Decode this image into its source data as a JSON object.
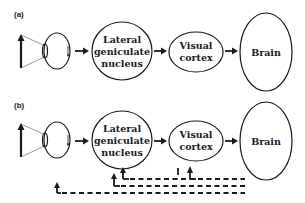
{
  "panels": [
    {
      "label": "(a)",
      "nodes": {
        "lgn": [
          "Lateral",
          "geniculate",
          "nucleus"
        ],
        "visual_cortex": [
          "Visual",
          "cortex"
        ],
        "brain": [
          "Brain"
        ]
      },
      "flow": [
        "eye",
        "lgn",
        "visual_cortex",
        "brain"
      ],
      "feedback": false
    },
    {
      "label": "(b)",
      "nodes": {
        "lgn": [
          "Lateral",
          "geniculate",
          "nucleus"
        ],
        "visual_cortex": [
          "Visual",
          "cortex"
        ],
        "brain": [
          "Brain"
        ]
      },
      "flow": [
        "eye",
        "lgn",
        "visual_cortex",
        "brain"
      ],
      "feedback": true,
      "feedback_paths": [
        {
          "from": "brain",
          "to": "lgn",
          "style": "dashed"
        },
        {
          "from": "brain",
          "to": "lgn",
          "style": "dashed"
        },
        {
          "from": "brain",
          "to": "eye",
          "style": "dashed"
        },
        {
          "from": "brain",
          "to": "visual_cortex",
          "style": "dashed"
        }
      ]
    }
  ],
  "colors": {
    "stroke": "#1a1a1a",
    "background": "#ffffff"
  }
}
